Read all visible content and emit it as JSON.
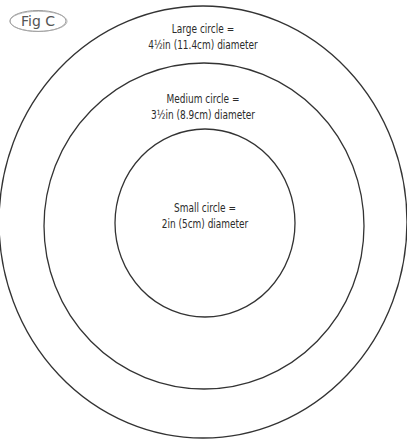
{
  "figure": {
    "badge": "Fig C",
    "stroke_color": "#333333",
    "background": "#ffffff"
  },
  "circles": {
    "large": {
      "line1": "Large circle =",
      "line2": "4½in (11.4cm) diameter"
    },
    "medium": {
      "line1": "Medium circle =",
      "line2": "3½in (8.9cm) diameter"
    },
    "small": {
      "line1": "Small circle =",
      "line2": "2in (5cm) diameter"
    }
  }
}
